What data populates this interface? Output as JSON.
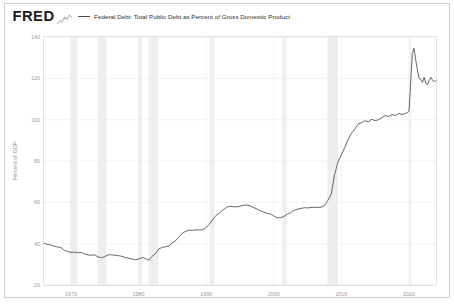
{
  "window": {
    "background": "#ffffff"
  },
  "header": {
    "logo_text": "FRED",
    "logo_mark_icon": "fred-squiggle-icon",
    "legend": {
      "marker_icon": "line-swatch-icon",
      "label": "Federal Debt: Total Public Debt as Percent of Gross Domestic Product",
      "color": "#4c4c4c"
    }
  },
  "chart_data": {
    "type": "line",
    "title": "Federal Debt: Total Public Debt as Percent of Gross Domestic Product",
    "xlabel": "",
    "ylabel": "Percent of GDP",
    "xlim": [
      1966,
      2024
    ],
    "ylim": [
      20,
      140
    ],
    "yticks": [
      140,
      120,
      100,
      80,
      60,
      40,
      20
    ],
    "xticks": [
      1970,
      1980,
      1990,
      2000,
      2010,
      2020
    ],
    "grid": true,
    "legend_position": "top",
    "line_color": "#4a4a4a",
    "recession_band_color": "#eceff1",
    "series": [
      {
        "name": "Federal Debt: Total Public Debt as Percent of Gross Domestic Product",
        "x": [
          1966.0,
          1966.5,
          1967.0,
          1967.5,
          1968.0,
          1968.5,
          1969.0,
          1969.5,
          1970.0,
          1970.5,
          1971.0,
          1971.5,
          1972.0,
          1972.5,
          1973.0,
          1973.5,
          1974.0,
          1974.5,
          1975.0,
          1975.5,
          1976.0,
          1976.5,
          1977.0,
          1977.5,
          1978.0,
          1978.5,
          1979.0,
          1979.5,
          1980.0,
          1980.5,
          1981.0,
          1981.5,
          1982.0,
          1982.5,
          1983.0,
          1983.5,
          1984.0,
          1984.5,
          1985.0,
          1985.5,
          1986.0,
          1986.5,
          1987.0,
          1987.5,
          1988.0,
          1988.5,
          1989.0,
          1989.5,
          1990.0,
          1990.5,
          1991.0,
          1991.5,
          1992.0,
          1992.5,
          1993.0,
          1993.5,
          1994.0,
          1994.5,
          1995.0,
          1995.5,
          1996.0,
          1996.5,
          1997.0,
          1997.5,
          1998.0,
          1998.5,
          1999.0,
          1999.5,
          2000.0,
          2000.5,
          2001.0,
          2001.5,
          2002.0,
          2002.5,
          2003.0,
          2003.5,
          2004.0,
          2004.5,
          2005.0,
          2005.5,
          2006.0,
          2006.5,
          2007.0,
          2007.5,
          2008.0,
          2008.5,
          2009.0,
          2009.5,
          2010.0,
          2010.5,
          2011.0,
          2011.5,
          2012.0,
          2012.5,
          2013.0,
          2013.5,
          2014.0,
          2014.5,
          2015.0,
          2015.5,
          2016.0,
          2016.5,
          2017.0,
          2017.5,
          2018.0,
          2018.5,
          2019.0,
          2019.5,
          2020.0,
          2020.25,
          2020.5,
          2020.75,
          2021.0,
          2021.25,
          2021.5,
          2021.75,
          2022.0,
          2022.25,
          2022.5,
          2022.75,
          2023.0,
          2023.25,
          2023.5,
          2023.75,
          2024.0
        ],
        "values": [
          40.2,
          39.6,
          39.4,
          38.8,
          38.4,
          38.1,
          36.8,
          36.2,
          35.8,
          35.9,
          35.6,
          35.8,
          35.0,
          34.6,
          34.4,
          34.6,
          33.6,
          33.2,
          33.8,
          34.6,
          34.6,
          34.4,
          34.2,
          33.9,
          33.3,
          33.0,
          32.6,
          32.2,
          32.5,
          33.3,
          32.8,
          32.0,
          33.9,
          35.2,
          37.5,
          38.2,
          38.5,
          38.9,
          40.5,
          41.5,
          43.4,
          45.2,
          46.0,
          46.6,
          46.4,
          46.7,
          46.6,
          46.8,
          47.9,
          49.6,
          51.9,
          53.8,
          55.0,
          56.4,
          57.6,
          58.0,
          57.9,
          57.8,
          58.1,
          58.6,
          58.7,
          58.3,
          57.5,
          56.8,
          55.9,
          55.3,
          54.7,
          54.4,
          53.4,
          52.5,
          52.5,
          53.2,
          54.3,
          55.0,
          56.1,
          56.7,
          57.0,
          57.4,
          57.3,
          57.5,
          57.6,
          57.6,
          57.6,
          58.5,
          61.0,
          64.0,
          73.5,
          79.5,
          83.0,
          86.5,
          90.5,
          93.5,
          95.5,
          98.0,
          98.5,
          99.5,
          99.0,
          100.2,
          99.5,
          100.0,
          101.0,
          102.0,
          101.5,
          102.5,
          102.0,
          103.0,
          102.5,
          103.0,
          104.0,
          118.0,
          132.0,
          134.5,
          129.0,
          124.0,
          120.0,
          119.5,
          118.0,
          120.5,
          117.5,
          117.0,
          119.0,
          120.5,
          119.0,
          118.5,
          118.8
        ]
      }
    ],
    "recessions": [
      {
        "start": 1969.92,
        "end": 1970.92
      },
      {
        "start": 1973.92,
        "end": 1975.25
      },
      {
        "start": 1980.0,
        "end": 1980.5
      },
      {
        "start": 1981.5,
        "end": 1982.92
      },
      {
        "start": 1990.5,
        "end": 1991.25
      },
      {
        "start": 2001.25,
        "end": 2001.92
      },
      {
        "start": 2007.92,
        "end": 2009.5
      },
      {
        "start": 2020.08,
        "end": 2020.33
      }
    ]
  }
}
